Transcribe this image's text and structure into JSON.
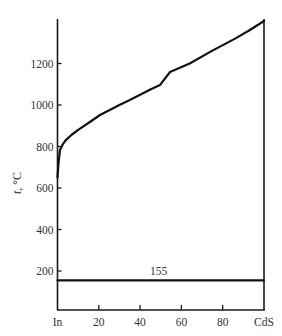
{
  "chart_data": {
    "type": "line",
    "title": "",
    "xlabel": "",
    "ylabel": "t, °C",
    "ylabel_italic_part": "t",
    "ylabel_rest": ", °C",
    "xlim": [
      0,
      100
    ],
    "ylim": [
      0,
      1410
    ],
    "grid": false,
    "legend": null,
    "x_ticks": [
      {
        "value": 0,
        "label": "In"
      },
      {
        "value": 20,
        "label": "20"
      },
      {
        "value": 40,
        "label": "40"
      },
      {
        "value": 60,
        "label": "60"
      },
      {
        "value": 80,
        "label": "80"
      },
      {
        "value": 100,
        "label": "CdS"
      }
    ],
    "y_ticks": [
      200,
      400,
      600,
      800,
      1000,
      1200
    ],
    "series": [
      {
        "name": "liquidus",
        "x": [
          0,
          0.5,
          1.2,
          2.5,
          4,
          7,
          10,
          15.7,
          20.6,
          30,
          35,
          45,
          49.6,
          54.5,
          64,
          75,
          86,
          93,
          100
        ],
        "values": [
          650,
          720,
          783,
          810,
          831,
          858,
          880,
          918,
          952,
          1000,
          1024,
          1075,
          1096,
          1159,
          1200,
          1262,
          1320,
          1360,
          1405
        ]
      },
      {
        "name": "eutectic",
        "x": [
          0,
          100
        ],
        "values": [
          155,
          155
        ]
      }
    ],
    "annotations": [
      {
        "text": "155",
        "x": 49,
        "y": 155,
        "position": "above-line"
      }
    ]
  }
}
